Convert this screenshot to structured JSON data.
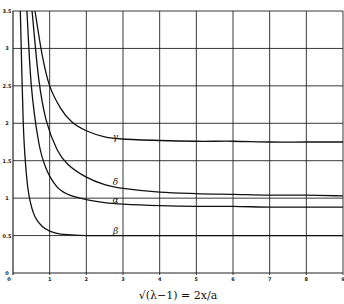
{
  "chart_data": {
    "type": "line",
    "title": "",
    "xlabel": "√(λ−1) = 2x/a",
    "ylabel": "",
    "xlim": [
      0,
      9
    ],
    "ylim": [
      0,
      3.5
    ],
    "grid": true,
    "legend": "none (inline curve labels)",
    "x_ticks": [
      "0",
      "1",
      "2",
      "3",
      "4",
      "5",
      "6",
      "7",
      "8",
      "9"
    ],
    "y_ticks": [
      "0",
      "0.5",
      "1",
      "1.5",
      "2",
      "2.5",
      "3",
      "3.5"
    ],
    "series": [
      {
        "name": "γ",
        "label_at": [
          2.85,
          1.8
        ],
        "x": [
          0.6,
          0.8,
          1.0,
          1.3,
          1.6,
          2.0,
          2.5,
          3.0,
          4.0,
          5.0,
          6.0,
          7.0,
          8.0,
          9.0
        ],
        "y": [
          3.5,
          2.9,
          2.5,
          2.2,
          2.02,
          1.9,
          1.82,
          1.79,
          1.77,
          1.76,
          1.76,
          1.75,
          1.75,
          1.75
        ]
      },
      {
        "name": "δ",
        "label_at": [
          2.85,
          1.2
        ],
        "x": [
          0.52,
          0.7,
          0.9,
          1.2,
          1.5,
          2.0,
          2.5,
          3.0,
          4.0,
          5.0,
          6.0,
          7.0,
          8.0,
          9.0
        ],
        "y": [
          3.5,
          2.6,
          2.05,
          1.65,
          1.45,
          1.28,
          1.18,
          1.13,
          1.08,
          1.06,
          1.05,
          1.04,
          1.04,
          1.03
        ]
      },
      {
        "name": "α",
        "label_at": [
          2.85,
          0.96
        ],
        "x": [
          0.38,
          0.5,
          0.7,
          0.9,
          1.2,
          1.5,
          2.0,
          2.5,
          3.0,
          4.0,
          5.0,
          6.0,
          7.0,
          8.0,
          9.0
        ],
        "y": [
          3.5,
          2.5,
          1.75,
          1.4,
          1.15,
          1.05,
          0.98,
          0.94,
          0.92,
          0.9,
          0.89,
          0.89,
          0.88,
          0.88,
          0.88
        ]
      },
      {
        "name": "β",
        "label_at": [
          2.85,
          0.55
        ],
        "x": [
          0.2,
          0.28,
          0.36,
          0.45,
          0.6,
          0.8,
          1.0,
          1.3,
          1.6,
          2.0,
          3.0,
          9.0
        ],
        "y": [
          3.5,
          2.0,
          1.35,
          1.0,
          0.75,
          0.62,
          0.56,
          0.52,
          0.51,
          0.5,
          0.5,
          0.5
        ]
      }
    ]
  }
}
